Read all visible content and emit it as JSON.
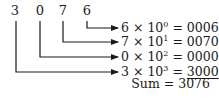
{
  "digits": [
    "3",
    "0",
    "7",
    "6"
  ],
  "rows": [
    {
      "digit": "6",
      "times": "×",
      "base": "10",
      "exp": "0",
      "eq": "=",
      "result": "0006"
    },
    {
      "digit": "7",
      "times": "×",
      "base": "10",
      "exp": "1",
      "eq": "=",
      "result": "0070"
    },
    {
      "digit": "0",
      "times": "×",
      "base": "10",
      "exp": "2",
      "eq": "=",
      "result": "0000"
    },
    {
      "digit": "3",
      "times": "×",
      "base": "10",
      "exp": "3",
      "eq": "=",
      "result": "3000"
    }
  ],
  "sum": {
    "label": "Sum",
    "eq": "=",
    "value": "3076"
  },
  "colors": {
    "line": "#1a1a1a",
    "text": "#1a1a1a"
  }
}
